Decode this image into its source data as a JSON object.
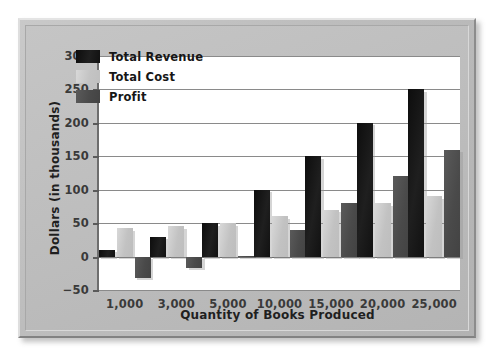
{
  "figure": {
    "frame_style": "beveled-gray-panel",
    "panel_color": "#bebebe",
    "plot_background": "#ffffff"
  },
  "chart_data": {
    "type": "bar",
    "title": "",
    "xlabel": "Quantity of Books Produced",
    "ylabel": "Dollars (in thousands)",
    "categories": [
      "1,000",
      "3,000",
      "5,000",
      "10,000",
      "15,000",
      "20,000",
      "25,000"
    ],
    "series": [
      {
        "name": "Total Revenue",
        "color": "#141414",
        "values": [
          10,
          30,
          50,
          100,
          150,
          200,
          250
        ]
      },
      {
        "name": "Total Cost",
        "color": "#c6c6c6",
        "values": [
          42,
          45,
          50,
          60,
          70,
          80,
          90
        ]
      },
      {
        "name": "Profit",
        "color": "#4a4a4a",
        "values": [
          -32,
          -17,
          1,
          40,
          80,
          120,
          160
        ]
      }
    ],
    "ylim": [
      -50,
      300
    ],
    "yticks": [
      300,
      250,
      200,
      150,
      100,
      50,
      0,
      -50
    ],
    "ytick_labels": [
      "300",
      "250",
      "200",
      "150",
      "100",
      "50",
      "0",
      "−50"
    ],
    "grid": true,
    "grid_axis": "y",
    "legend_position": "upper-left-inside",
    "zero_line": 0
  }
}
